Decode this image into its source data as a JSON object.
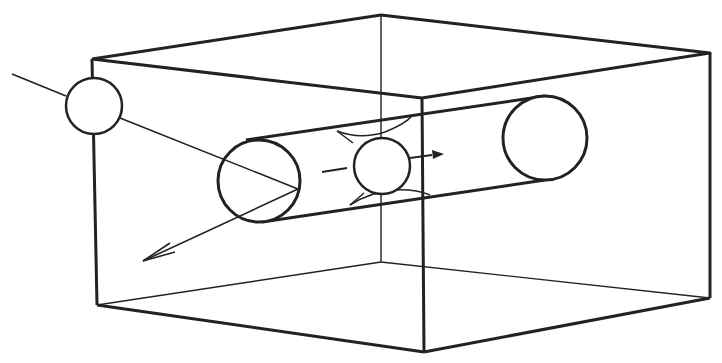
{
  "diagram": {
    "colors": {
      "stroke": "#222222",
      "background": "#ffffff",
      "stipple": "#333333"
    },
    "elements": [
      {
        "id": "box",
        "label": "rectangular box (wireframe)"
      },
      {
        "id": "cylinder",
        "label": "cylindrical channel through box"
      },
      {
        "id": "sphere-incoming",
        "label": "incoming particle on trajectory line"
      },
      {
        "id": "sphere-in-channel",
        "label": "particle moving through channel"
      },
      {
        "id": "arrow-deflected",
        "label": "deflected trajectory arrow"
      },
      {
        "id": "arrow-channel",
        "label": "channel motion arrow"
      }
    ]
  }
}
